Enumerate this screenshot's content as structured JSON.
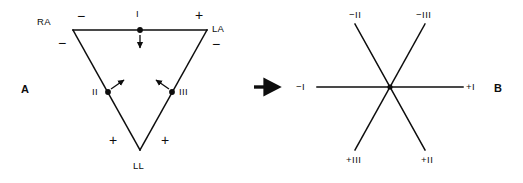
{
  "figure": {
    "panels": [
      {
        "id": "A",
        "letter": "A"
      },
      {
        "id": "B",
        "letter": "B"
      }
    ],
    "transition_arrow": "right-arrow"
  },
  "panel_a": {
    "name": "einthoven-triangle",
    "electrodes": [
      {
        "id": "RA",
        "label": "RA",
        "full": "right arm"
      },
      {
        "id": "LA",
        "label": "LA",
        "full": "left arm"
      },
      {
        "id": "LL",
        "label": "LL",
        "full": "left leg"
      }
    ],
    "leads": [
      {
        "id": "I",
        "label": "I"
      },
      {
        "id": "II",
        "label": "II"
      },
      {
        "id": "III",
        "label": "III"
      }
    ],
    "polarity_marks": [
      {
        "id": "lead1-negative",
        "label": "−"
      },
      {
        "id": "lead1-positive",
        "label": "+"
      },
      {
        "id": "lead2-negative",
        "label": "−"
      },
      {
        "id": "lead2-positive",
        "label": "+"
      },
      {
        "id": "lead3-negative",
        "label": "−"
      },
      {
        "id": "lead3-positive",
        "label": "+"
      }
    ]
  },
  "panel_b": {
    "name": "triaxial-reference-system",
    "axes": [
      {
        "id": "lead1",
        "negative": "−I",
        "positive": "+I"
      },
      {
        "id": "lead2",
        "negative": "−II",
        "positive": "+II"
      },
      {
        "id": "lead3",
        "negative": "−III",
        "positive": "+III"
      }
    ]
  },
  "style": {
    "stroke": "#0d0d0d",
    "text": "#0d0d0d",
    "background": "#ffffff"
  }
}
